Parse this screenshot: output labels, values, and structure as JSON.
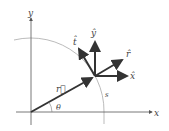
{
  "labels": {
    "x_axis": "x",
    "y_axis": "y",
    "r_vec": "r⃗",
    "theta": "θ",
    "arc": "s",
    "t_hat": "t̂",
    "y_hat": "ŷ",
    "r_hat": "r̂",
    "x_hat": "x̂"
  },
  "colors": {
    "axis": "#555555",
    "vector": "#333333",
    "arc": "#aaaaaa"
  }
}
